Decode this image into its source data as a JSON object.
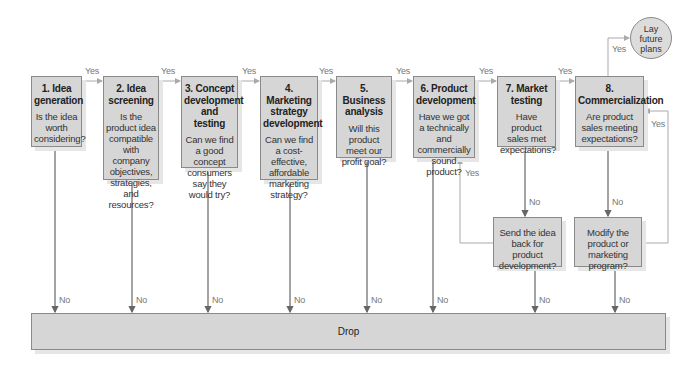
{
  "diagram": {
    "stages": [
      {
        "title": "1. Idea generation",
        "question": "Is the idea worth considering?"
      },
      {
        "title": "2. Idea screening",
        "question": "Is the product idea compatible with company objectives, strategies, and resources?"
      },
      {
        "title": "3. Concept development and testing",
        "question": "Can we find a good concept consumers say they would try?"
      },
      {
        "title": "4. Marketing strategy development",
        "question": "Can we find a cost-effective, affordable marketing strategy?"
      },
      {
        "title": "5. Business analysis",
        "question": "Will this product meet our profit goal?"
      },
      {
        "title": "6. Product development",
        "question": "Have we got a technically and commercially sound product?"
      },
      {
        "title": "7. Market testing",
        "question": "Have product sales met expectations?"
      },
      {
        "title": "8. Commercialization",
        "question": "Are product sales meeting expectations?"
      }
    ],
    "send_back": "Send the idea back for product development?",
    "modify": "Modify the product or marketing program?",
    "lay_future_plans": "Lay future plans",
    "drop": "Drop",
    "yes_label": "Yes",
    "no_label": "No"
  }
}
